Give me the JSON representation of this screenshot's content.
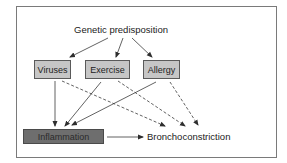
{
  "diagram": {
    "type": "causal-flow",
    "nodes": {
      "genetic": {
        "label": "Genetic predisposition"
      },
      "viruses": {
        "label": "Viruses"
      },
      "exercise": {
        "label": "Exercise"
      },
      "allergy": {
        "label": "Allergy"
      },
      "inflammation": {
        "label": "Inflammation"
      },
      "bronchoconstriction": {
        "label": "Bronchoconstriction"
      }
    },
    "edges": [
      {
        "from": "genetic",
        "to": "viruses",
        "style": "solid"
      },
      {
        "from": "genetic",
        "to": "exercise",
        "style": "solid"
      },
      {
        "from": "genetic",
        "to": "allergy",
        "style": "solid"
      },
      {
        "from": "viruses",
        "to": "inflammation",
        "style": "solid"
      },
      {
        "from": "exercise",
        "to": "inflammation",
        "style": "solid"
      },
      {
        "from": "allergy",
        "to": "inflammation",
        "style": "solid"
      },
      {
        "from": "viruses",
        "to": "bronchoconstriction",
        "style": "dashed"
      },
      {
        "from": "exercise",
        "to": "bronchoconstriction",
        "style": "dashed"
      },
      {
        "from": "allergy",
        "to": "bronchoconstriction",
        "style": "dashed"
      },
      {
        "from": "inflammation",
        "to": "bronchoconstriction",
        "style": "solid"
      }
    ],
    "colors": {
      "trigger_box_fill": "#c6c6c6",
      "inflammation_fill": "#6e6e6e",
      "line": "#3a3a3a",
      "frame_border": "#7a7a7a"
    }
  }
}
